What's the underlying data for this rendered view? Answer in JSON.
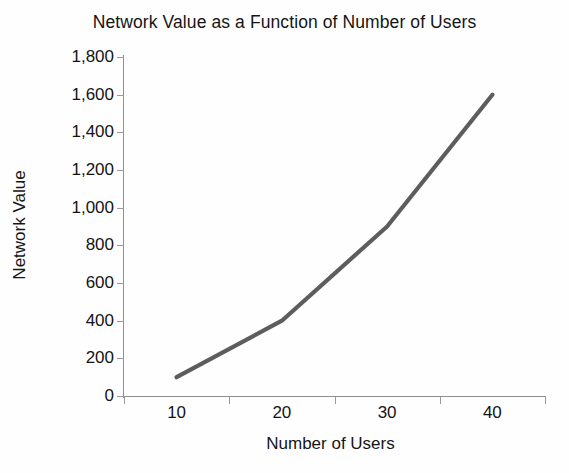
{
  "chart_data": {
    "type": "line",
    "title": "Network Value as a Function of Number of Users",
    "xlabel": "Number of Users",
    "ylabel": "Network Value",
    "categories": [
      10,
      20,
      30,
      40
    ],
    "x_tick_labels": [
      "10",
      "20",
      "30",
      "40"
    ],
    "y_tick_labels": [
      "0",
      "200",
      "400",
      "600",
      "800",
      "1,000",
      "1,200",
      "1,400",
      "1,600",
      "1,800"
    ],
    "y_tick_values": [
      0,
      200,
      400,
      600,
      800,
      1000,
      1200,
      1400,
      1600,
      1800
    ],
    "ylim": [
      0,
      1800
    ],
    "grid": false,
    "legend": false,
    "series": [
      {
        "name": "Network Value",
        "color": "#5d5d5d",
        "values": [
          100,
          400,
          900,
          1600
        ]
      }
    ],
    "points": [
      {
        "x": 10,
        "y": 100
      },
      {
        "x": 20,
        "y": 400
      },
      {
        "x": 30,
        "y": 900
      },
      {
        "x": 40,
        "y": 1600
      }
    ]
  },
  "axes": {
    "axis_color": "#909090",
    "tick_color": "#9a9a9a",
    "text_color": "#141414"
  }
}
